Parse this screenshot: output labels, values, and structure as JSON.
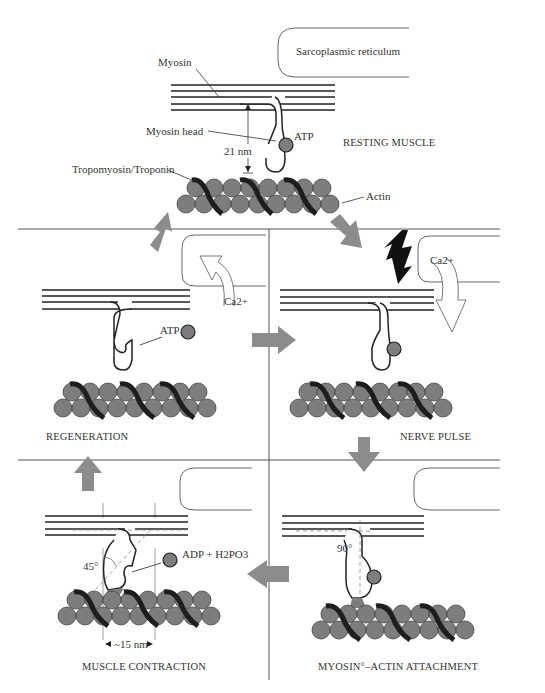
{
  "diagram": {
    "colors": {
      "actin": "#7d7d7d",
      "tropomyosin": "#1e1e1e",
      "arrow": "#8c8c8c",
      "line": "#333333",
      "divider": "#555555"
    },
    "panels": {
      "resting": {
        "title": "RESTING MUSCLE",
        "labels": {
          "sr": "Sarcoplasmic reticulum",
          "myosin": "Myosin",
          "myosin_head": "Myosin head",
          "atp": "ATP",
          "distance": "21 nm",
          "tropomyosin": "Tropomyosin/Troponin",
          "actin": "Actin"
        }
      },
      "regeneration": {
        "title": "REGENERATION",
        "labels": {
          "atp": "ATP",
          "calcium": "Ca2+"
        }
      },
      "nerve_pulse": {
        "title": "NERVE PULSE",
        "labels": {
          "calcium": "Ca2+"
        }
      },
      "contraction": {
        "title": "MUSCLE CONTRACTION",
        "labels": {
          "angle": "45°",
          "products": "ADP + H2PO3",
          "distance": "~15 nm"
        }
      },
      "attachment": {
        "title": "MYOSIN°–ACTIN ATTACHMENT",
        "labels": {
          "angle": "90°"
        }
      }
    }
  }
}
